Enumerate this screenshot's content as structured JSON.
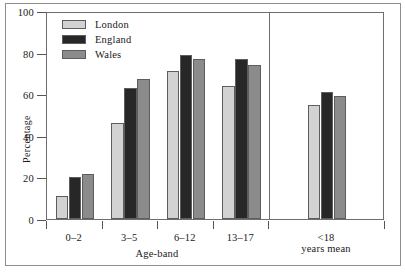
{
  "chart_data": {
    "type": "bar",
    "title": "",
    "subtitle": "",
    "xlabel": "Age-band",
    "ylabel": "Percentage",
    "categories": [
      "0–2",
      "3–5",
      "6–12",
      "13–17",
      "<18 years mean"
    ],
    "category_lines": [
      [
        "0–2"
      ],
      [
        "3–5"
      ],
      [
        "6–12"
      ],
      [
        "13–17"
      ],
      [
        "<18",
        "years mean"
      ]
    ],
    "series": [
      {
        "name": "London",
        "color": "#d2d2d2",
        "values": [
          11,
          46,
          71,
          64,
          55
        ]
      },
      {
        "name": "England",
        "color": "#272727",
        "values": [
          20,
          63,
          79,
          77,
          61
        ]
      },
      {
        "name": "Wales",
        "color": "#8b8b8b",
        "values": [
          21.5,
          67.5,
          77,
          74,
          59
        ]
      }
    ],
    "ylim": [
      0,
      100
    ],
    "yticks": [
      0,
      20,
      40,
      60,
      80,
      100
    ],
    "ytick_labels": [
      "0",
      "20",
      "40",
      "60",
      "80",
      "100"
    ],
    "grid": false,
    "legend_position": "top-left",
    "separator_after_category_index": 3,
    "bar_border_color": "#5d5d5d",
    "axis_color": "#6e6e6e",
    "frame_color": "#8d8d8d",
    "background": "#ffffff"
  }
}
